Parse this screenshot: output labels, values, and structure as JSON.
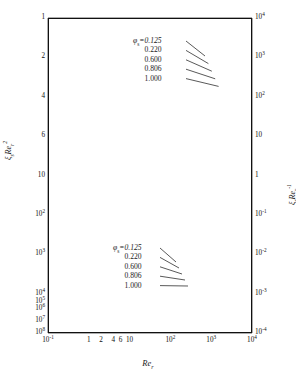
{
  "chart_data": {
    "type": "line",
    "title": "",
    "xlabel": "Re_r",
    "ylabel_left": "xi_s Re_r^2",
    "ylabel_right": "xi_s Re_r^-1",
    "xscale": "log",
    "yscale": "log",
    "xlim": [
      0.1,
      10000
    ],
    "ylim_left": [
      1,
      100000000
    ],
    "ylim_right": [
      0.0001,
      10000
    ],
    "grid": true,
    "legend_position": "inside-upper-center and inside-lower-center",
    "xticks": [
      "10⁻¹",
      "1",
      "2",
      "4",
      "6",
      "10",
      "10²",
      "10³",
      "10⁴"
    ],
    "xtick_values": [
      0.1,
      1,
      2,
      4,
      6,
      10,
      100,
      1000,
      10000
    ],
    "yticks_left": [
      "1",
      "2",
      "4",
      "6",
      "10",
      "10²",
      "10³",
      "10⁴",
      "10⁵",
      "10⁶",
      "10⁷",
      "10⁸"
    ],
    "ytick_left_values": [
      1,
      2,
      4,
      6,
      10,
      100,
      1000,
      10000,
      100000,
      1000000,
      10000000,
      100000000
    ],
    "yticks_right": [
      "10⁴",
      "10³",
      "10²",
      "10",
      "1",
      "10⁻¹",
      "10⁻²",
      "10⁻³",
      "10⁻⁴"
    ],
    "ytick_right_values": [
      10000,
      1000,
      100,
      10,
      1,
      0.1,
      0.01,
      0.001,
      0.0001
    ],
    "series_groups": [
      {
        "name": "upper-family-rising",
        "axis": "right",
        "arrow": "left",
        "legend_title": "φₛ=",
        "series": [
          {
            "name": "0.125",
            "x": [
              0.1,
              1,
              10,
              100,
              1000,
              10000
            ],
            "y": [
              0.00032,
              0.0056,
              0.085,
              1.1,
              13.0,
              150.0
            ]
          },
          {
            "name": "0.220",
            "x": [
              0.1,
              1,
              10,
              100,
              1000,
              10000
            ],
            "y": [
              0.00045,
              0.008,
              0.12,
              1.5,
              18.0,
              210.0
            ]
          },
          {
            "name": "0.600",
            "x": [
              0.1,
              1,
              10,
              100,
              1000,
              10000
            ],
            "y": [
              0.00075,
              0.0135,
              0.2,
              2.5,
              30.0,
              360.0
            ]
          },
          {
            "name": "0.806",
            "x": [
              0.1,
              1,
              10,
              100,
              1000,
              10000
            ],
            "y": [
              0.00105,
              0.019,
              0.28,
              3.5,
              42.0,
              500.0
            ]
          },
          {
            "name": "1.000",
            "x": [
              0.1,
              1,
              10,
              100,
              1000,
              10000
            ],
            "y": [
              0.0015,
              0.027,
              0.4,
              5.0,
              60.0,
              720.0
            ]
          }
        ]
      },
      {
        "name": "lower-family-falling",
        "axis": "left",
        "arrow": "right",
        "legend_title": "φₛ=",
        "series": [
          {
            "name": "0.125",
            "x": [
              0.1,
              1,
              10,
              100,
              1000,
              10000
            ],
            "y": [
              100000000.0,
              800000.0,
              13000.0,
              330.0,
              12.0,
              0.6
            ]
          },
          {
            "name": "0.220",
            "x": [
              0.1,
              1,
              10,
              100,
              1000,
              10000
            ],
            "y": [
              80000000.0,
              600000.0,
              9000.0,
              220.0,
              8.0,
              0.4
            ]
          },
          {
            "name": "0.600",
            "x": [
              0.1,
              1,
              10,
              100,
              1000,
              10000
            ],
            "y": [
              55000000.0,
              380000.0,
              5500.0,
              130.0,
              4.6,
              0.22
            ]
          },
          {
            "name": "0.806",
            "x": [
              0.1,
              1,
              10,
              100,
              1000,
              10000
            ],
            "y": [
              42000000.0,
              280000.0,
              3800.0,
              88.0,
              3.0,
              0.14
            ]
          },
          {
            "name": "1.000",
            "x": [
              0.1,
              1,
              10,
              100,
              1000,
              10000
            ],
            "y": [
              32000000.0,
              200000.0,
              2600.0,
              58.0,
              1.9,
              0.085
            ]
          }
        ]
      }
    ]
  },
  "axes": {
    "left_label_html": "ξ<sub>s</sub>Re<sub>r</sub><sup>2</sup>",
    "right_label_html": "ξ<sub>s</sub>Re<sub>r</sub><sup>-1</sup>",
    "x_label_html": "Re<sub>r</sub>"
  },
  "legend_top": {
    "header": "φ",
    "header_sub": "s",
    "header_eq": "=0.125",
    "rows": [
      "0.220",
      "0.600",
      "0.806",
      "1.000"
    ]
  },
  "legend_bottom": {
    "header": "φ",
    "header_sub": "s",
    "header_eq": "=0.125",
    "rows": [
      "0.220",
      "0.600",
      "0.806",
      "1.000"
    ]
  },
  "xtick_labels": [
    {
      "t": "10",
      "sup": "-1"
    },
    {
      "t": "1",
      "sup": ""
    },
    {
      "t": "2",
      "sup": ""
    },
    {
      "t": "4",
      "sup": ""
    },
    {
      "t": "6",
      "sup": ""
    },
    {
      "t": "10",
      "sup": ""
    },
    {
      "t": "10",
      "sup": "2"
    },
    {
      "t": "10",
      "sup": "3"
    },
    {
      "t": "10",
      "sup": "4"
    }
  ],
  "ytick_left_labels": [
    {
      "t": "10",
      "sup": "8"
    },
    {
      "t": "10",
      "sup": "7"
    },
    {
      "t": "10",
      "sup": "6"
    },
    {
      "t": "10",
      "sup": "5"
    },
    {
      "t": "10",
      "sup": "4"
    },
    {
      "t": "10",
      "sup": "3"
    },
    {
      "t": "10",
      "sup": "2"
    },
    {
      "t": "10",
      "sup": ""
    },
    {
      "t": "6",
      "sup": ""
    },
    {
      "t": "4",
      "sup": ""
    },
    {
      "t": "2",
      "sup": ""
    },
    {
      "t": "1",
      "sup": ""
    }
  ],
  "ytick_right_labels": [
    {
      "t": "10",
      "sup": "4"
    },
    {
      "t": "10",
      "sup": "3"
    },
    {
      "t": "10",
      "sup": "2"
    },
    {
      "t": "10",
      "sup": ""
    },
    {
      "t": "1",
      "sup": ""
    },
    {
      "t": "10",
      "sup": "-1"
    },
    {
      "t": "10",
      "sup": "-2"
    },
    {
      "t": "10",
      "sup": "-3"
    },
    {
      "t": "10",
      "sup": "-4"
    }
  ],
  "colors": {
    "curve": "#111111",
    "grid_major": "#4a4a4a",
    "grid_minor": "#9a9a9a",
    "frame": "#111111",
    "background": "#ffffff"
  }
}
